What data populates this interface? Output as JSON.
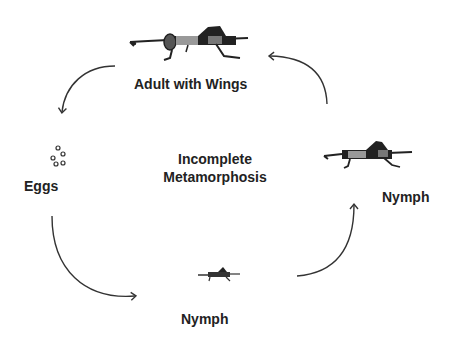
{
  "diagram": {
    "title": "Incomplete Metamorphosis",
    "title_lines": [
      "Incomplete",
      "Metamorphosis"
    ],
    "stages": [
      {
        "id": "adult",
        "label": "Adult with Wings",
        "icon": "adult-grasshopper-icon"
      },
      {
        "id": "eggs",
        "label": "Eggs",
        "icon": "eggs-icon"
      },
      {
        "id": "nymph-small",
        "label": "Nymph",
        "icon": "small-nymph-icon"
      },
      {
        "id": "nymph-large",
        "label": "Nymph",
        "icon": "large-nymph-icon"
      }
    ],
    "cycle_order": [
      "Adult with Wings",
      "Eggs",
      "Nymph",
      "Nymph",
      "Adult with Wings"
    ],
    "colors": {
      "ink": "#222222",
      "body_gray": "#888888",
      "arrow": "#333333"
    }
  }
}
